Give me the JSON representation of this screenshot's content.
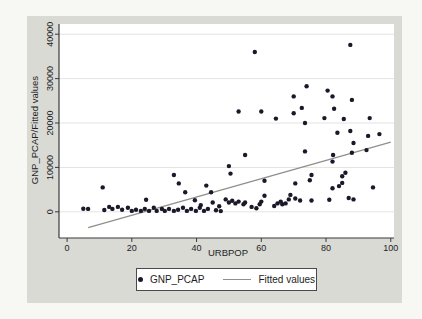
{
  "figure": {
    "background_color": "#f7f7f4",
    "panel_color": "#d9dad4",
    "plot_color": "#ffffff",
    "grid_color": "#e1e5e2",
    "axis_color": "#3a3a3a",
    "dot_color": "#191929",
    "fitted_line_color": "#8f8f8d",
    "text_color": "#1d1d24"
  },
  "chart_data": {
    "type": "scatter",
    "title": "",
    "xlabel": "URBPOP",
    "ylabel": "GNP_PCAP/Fitted values",
    "xlim": [
      -2.5,
      101
    ],
    "ylim": [
      -5900,
      42300
    ],
    "xticks": [
      0,
      20,
      40,
      60,
      80,
      100
    ],
    "yticks": [
      0,
      10000,
      20000,
      30000,
      40000
    ],
    "grid": "horizontal",
    "legend_position": "bottom-center",
    "series": [
      {
        "name": "GNP_PCAP",
        "type": "scatter",
        "points": [
          [
            5,
            700
          ],
          [
            6.5,
            650
          ],
          [
            11,
            5500
          ],
          [
            11.5,
            400
          ],
          [
            13,
            1100
          ],
          [
            14,
            650
          ],
          [
            15.7,
            1100
          ],
          [
            17,
            450
          ],
          [
            18.8,
            900
          ],
          [
            20,
            200
          ],
          [
            21.3,
            450
          ],
          [
            22.8,
            200
          ],
          [
            24,
            650
          ],
          [
            24.4,
            2700
          ],
          [
            25.3,
            200
          ],
          [
            26.8,
            900
          ],
          [
            27.7,
            200
          ],
          [
            29.3,
            650
          ],
          [
            30.2,
            200
          ],
          [
            31.5,
            650
          ],
          [
            33,
            200
          ],
          [
            33,
            8300
          ],
          [
            34.3,
            450
          ],
          [
            34.5,
            6400
          ],
          [
            35.8,
            900
          ],
          [
            36.5,
            4400
          ],
          [
            37,
            200
          ],
          [
            38.3,
            650
          ],
          [
            39.5,
            2600
          ],
          [
            39.8,
            200
          ],
          [
            41,
            900
          ],
          [
            41.3,
            1500
          ],
          [
            42.3,
            200
          ],
          [
            43,
            5900
          ],
          [
            43.5,
            650
          ],
          [
            44.5,
            4400
          ],
          [
            45,
            2100
          ],
          [
            46,
            350
          ],
          [
            47,
            1250
          ],
          [
            47.5,
            150
          ],
          [
            49,
            2800
          ],
          [
            50,
            2100
          ],
          [
            50,
            10300
          ],
          [
            50.5,
            8600
          ],
          [
            51,
            2500
          ],
          [
            52,
            1900
          ],
          [
            53,
            2300
          ],
          [
            53,
            22600
          ],
          [
            54.5,
            1700
          ],
          [
            55,
            2100
          ],
          [
            55,
            12800
          ],
          [
            57,
            1100
          ],
          [
            58,
            36000
          ],
          [
            58.5,
            800
          ],
          [
            59.5,
            1700
          ],
          [
            60,
            2300
          ],
          [
            60,
            22600
          ],
          [
            61,
            3600
          ],
          [
            61,
            7000
          ],
          [
            64,
            1300
          ],
          [
            64.5,
            21000
          ],
          [
            65,
            1900
          ],
          [
            66,
            2300
          ],
          [
            66.5,
            1700
          ],
          [
            67.5,
            1900
          ],
          [
            68.5,
            2800
          ],
          [
            69,
            3800
          ],
          [
            70,
            26000
          ],
          [
            70,
            22200
          ],
          [
            70.5,
            3000
          ],
          [
            70.5,
            6400
          ],
          [
            72,
            2550
          ],
          [
            72.5,
            23400
          ],
          [
            73.5,
            20000
          ],
          [
            73.5,
            13600
          ],
          [
            74,
            28300
          ],
          [
            75,
            7100
          ],
          [
            75.5,
            2550
          ],
          [
            75.5,
            8300
          ],
          [
            79.5,
            21100
          ],
          [
            80.5,
            27300
          ],
          [
            81,
            2700
          ],
          [
            82,
            5300
          ],
          [
            82,
            26000
          ],
          [
            82,
            11300
          ],
          [
            82.2,
            12800
          ],
          [
            82.5,
            23200
          ],
          [
            83.5,
            17800
          ],
          [
            84,
            5800
          ],
          [
            85,
            6500
          ],
          [
            85,
            8000
          ],
          [
            85.5,
            20900
          ],
          [
            86,
            8800
          ],
          [
            87,
            3100
          ],
          [
            87.5,
            18200
          ],
          [
            87.5,
            37600
          ],
          [
            88,
            25200
          ],
          [
            88,
            13300
          ],
          [
            88.5,
            2800
          ],
          [
            88.5,
            15500
          ],
          [
            92.5,
            13900
          ],
          [
            93,
            17100
          ],
          [
            93.5,
            21100
          ],
          [
            94.5,
            5500
          ],
          [
            96.5,
            17500
          ]
        ]
      },
      {
        "name": "Fitted values",
        "type": "line",
        "points": [
          [
            6.5,
            -3580
          ],
          [
            100,
            15680
          ]
        ]
      }
    ]
  },
  "legend": {
    "gnp_label": "GNP_PCAP",
    "fitted_label": "Fitted values"
  }
}
